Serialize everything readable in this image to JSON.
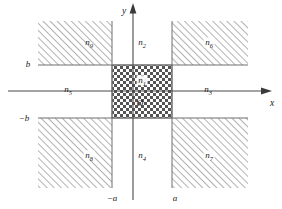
{
  "figure": {
    "background_color": "#ffffff",
    "line_color": "#555555",
    "axis_color": "#4a4a4a",
    "hatch_color": "#8a8a8a",
    "checker_color": "#4d4d4d",
    "text_color": "#1a1a1a"
  },
  "axes": {
    "x_axis_label": "x",
    "y_axis_label": "y",
    "origin_label": "O"
  },
  "ticks": {
    "x_negative": "−a",
    "x_positive": "a",
    "y_positive": "b",
    "y_negative": "−b"
  },
  "regions": [
    {
      "id": "n1",
      "label": "n",
      "subscript": "1",
      "fill": "checkerboard",
      "position": "center-core",
      "x": 142,
      "y": 86
    },
    {
      "id": "n2",
      "label": "n",
      "subscript": "2",
      "fill": "plain",
      "position": "top-center",
      "x": 142,
      "y": 44
    },
    {
      "id": "n3",
      "label": "n",
      "subscript": "3",
      "fill": "plain",
      "position": "middle-right",
      "x": 208,
      "y": 91
    },
    {
      "id": "n4",
      "label": "n",
      "subscript": "4",
      "fill": "plain",
      "position": "bottom-center",
      "x": 142,
      "y": 157
    },
    {
      "id": "n5",
      "label": "n",
      "subscript": "5",
      "fill": "plain",
      "position": "middle-left",
      "x": 68,
      "y": 91
    },
    {
      "id": "n6",
      "label": "n",
      "subscript": "6",
      "fill": "hatched",
      "position": "top-right",
      "x": 209,
      "y": 44
    },
    {
      "id": "n7",
      "label": "n",
      "subscript": "7",
      "fill": "hatched",
      "position": "bottom-right",
      "x": 209,
      "y": 157
    },
    {
      "id": "n8",
      "label": "n",
      "subscript": "8",
      "fill": "hatched",
      "position": "bottom-left",
      "x": 89,
      "y": 157
    },
    {
      "id": "n9",
      "label": "n",
      "subscript": "9",
      "fill": "hatched",
      "position": "top-left",
      "x": 89,
      "y": 44
    }
  ],
  "geometry": {
    "core_left": 112,
    "core_right": 172,
    "core_top": 65,
    "core_bottom": 118,
    "outer_left": 38,
    "outer_right": 248,
    "outer_top": 21,
    "outer_bottom": 188,
    "x_axis_y": 91,
    "y_axis_x": 133
  }
}
